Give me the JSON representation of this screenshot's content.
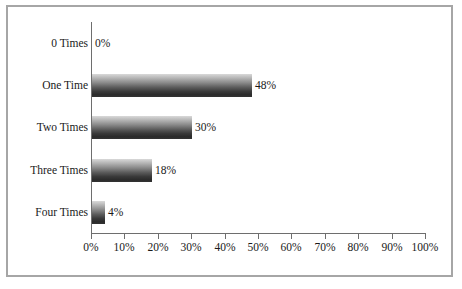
{
  "chart_data": {
    "type": "bar",
    "orientation": "horizontal",
    "title": "",
    "subtitle": "",
    "xlabel": "",
    "ylabel": "",
    "categories": [
      "0 Times",
      "One Time",
      "Two Times",
      "Three Times",
      "Four Times"
    ],
    "values": [
      0,
      48,
      30,
      18,
      4
    ],
    "data_labels": [
      "0%",
      "48%",
      "30%",
      "18%",
      "4%"
    ],
    "xlim": [
      0,
      100
    ],
    "xticks": [
      0,
      10,
      20,
      30,
      40,
      50,
      60,
      70,
      80,
      90,
      100
    ],
    "xtick_labels": [
      "0%",
      "10%",
      "20%",
      "30%",
      "40%",
      "50%",
      "60%",
      "70%",
      "80%",
      "90%",
      "100%"
    ],
    "grid": false,
    "legend": null,
    "legend_position": "none",
    "series": [
      {
        "name": "Percent",
        "values": [
          0,
          48,
          30,
          18,
          4
        ]
      }
    ],
    "colors": {
      "bar_gradient_top": "#d9d9d9",
      "bar_gradient_bottom": "#2b2b2b",
      "axis": "#6e6e6e",
      "frame": "#a6a6a6",
      "text": "#1a1a1a",
      "background": "#ffffff"
    }
  }
}
